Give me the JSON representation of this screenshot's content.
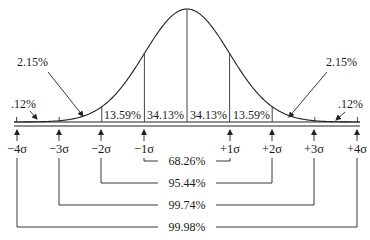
{
  "diagram": {
    "type": "normal-distribution",
    "colors": {
      "line": "#222222",
      "text": "#1a1a1a",
      "background": "#ffffff"
    },
    "axis": {
      "ticks": [
        {
          "label": "−4σ",
          "x": 17
        },
        {
          "label": "−3σ",
          "x": 59
        },
        {
          "label": "−2σ",
          "x": 101
        },
        {
          "label": "−1σ",
          "x": 144
        },
        {
          "label": "+1σ",
          "x": 230
        },
        {
          "label": "+2σ",
          "x": 272
        },
        {
          "label": "+3σ",
          "x": 314
        },
        {
          "label": "+4σ",
          "x": 357
        }
      ]
    },
    "regions": {
      "left_1_2": "13.59%",
      "left_0_1": "34.13%",
      "right_0_1": "34.13%",
      "right_1_2": "13.59%",
      "left_2_3": "2.15%",
      "right_2_3": "2.15%",
      "left_tail": ".12%",
      "right_tail": ".12%"
    },
    "ranges": [
      {
        "label": "68.26%",
        "from": "−1σ",
        "to": "+1σ"
      },
      {
        "label": "95.44%",
        "from": "−2σ",
        "to": "+2σ"
      },
      {
        "label": "99.74%",
        "from": "−3σ",
        "to": "+3σ"
      },
      {
        "label": "99.98%",
        "from": "−4σ",
        "to": "+4σ"
      }
    ]
  }
}
